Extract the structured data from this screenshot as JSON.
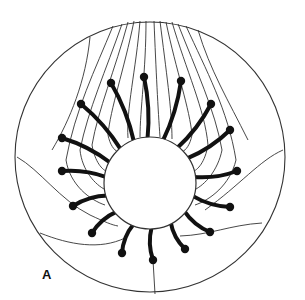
{
  "figure": {
    "panel_label": "A",
    "colors": {
      "stroke": "#333333",
      "spoke": "#111111",
      "background": "#ffffff"
    },
    "outer_circle": {
      "cx": 150,
      "cy": 157,
      "r": 135
    },
    "inner_circle": {
      "cx": 150,
      "cy": 183,
      "r": 46
    },
    "spokes": [
      {
        "tip": [
          144,
          77
        ]
      },
      {
        "tip": [
          111,
          83
        ]
      },
      {
        "tip": [
          81,
          104
        ]
      },
      {
        "tip": [
          62,
          138
        ]
      },
      {
        "tip": [
          62,
          171
        ]
      },
      {
        "tip": [
          73,
          206
        ]
      },
      {
        "tip": [
          92,
          233
        ]
      },
      {
        "tip": [
          122,
          253
        ]
      },
      {
        "tip": [
          153,
          260
        ]
      },
      {
        "tip": [
          185,
          249
        ]
      },
      {
        "tip": [
          210,
          232
        ]
      },
      {
        "tip": [
          230,
          207
        ]
      },
      {
        "tip": [
          237,
          171
        ]
      },
      {
        "tip": [
          230,
          130
        ]
      },
      {
        "tip": [
          211,
          104
        ]
      },
      {
        "tip": [
          181,
          81
        ]
      }
    ]
  }
}
